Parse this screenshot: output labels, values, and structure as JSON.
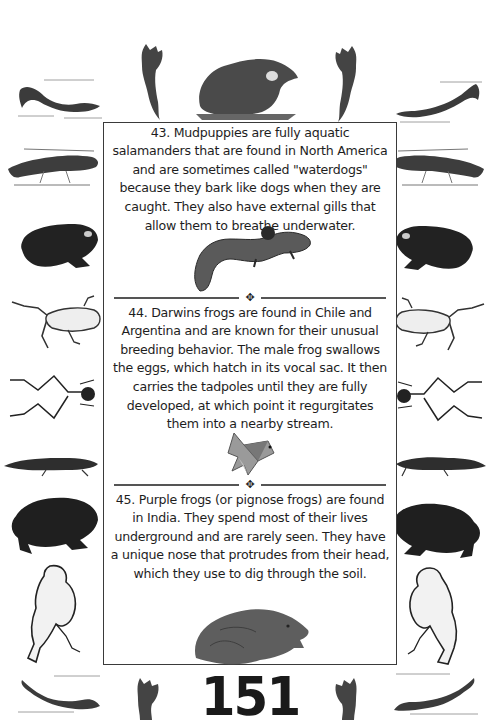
{
  "page": {
    "background": "#ffffff",
    "frame_color": "#3a3a3a",
    "page_number": "151"
  },
  "facts": [
    {
      "number": 43,
      "text": "43. Mudpuppies are fully aquatic salamanders that are found in North America and are sometimes called \"waterdogs\" because they bark like dogs when they are caught. They also have external gills that allow them to breathe underwater.",
      "illustration": "mudpuppy-illustration"
    },
    {
      "number": 44,
      "text": "44. Darwins frogs are found in Chile and Argentina and are known for their unusual breeding behavior. The male frog swallows the eggs, which hatch in its vocal sac. It then carries the tadpoles until they are fully developed, at which point it regurgitates them into a nearby stream.",
      "illustration": "origami-frog-illustration"
    },
    {
      "number": 45,
      "text": "45. Purple frogs (or pignose frogs) are found in India. They spend most of their lives underground and are rarely seen. They have a unique nose that protrudes from their head, which they use to dig through the soil.",
      "illustration": "purple-frog-illustration"
    }
  ],
  "dividers": [
    {
      "ornament": "✥"
    },
    {
      "ornament": "✥"
    }
  ],
  "border_illustrations": {
    "top": [
      "salamander",
      "axolotl",
      "bullfrog",
      "axolotl",
      "salamander"
    ],
    "left": [
      "newt",
      "toad",
      "frog",
      "frog-skeleton",
      "newt",
      "toad",
      "frog-sitting"
    ],
    "right": [
      "newt",
      "toad",
      "frog",
      "frog-skeleton",
      "newt",
      "toad",
      "frog-sitting"
    ],
    "bottom": [
      "salamander",
      "axolotl",
      "axolotl",
      "salamander"
    ]
  }
}
